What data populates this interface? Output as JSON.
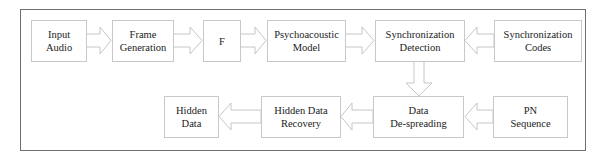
{
  "diagram": {
    "type": "block-flow",
    "nodes": [
      {
        "id": "input_audio",
        "lines": [
          "Input",
          "Audio"
        ]
      },
      {
        "id": "frame_generation",
        "lines": [
          "Frame",
          "Generation"
        ]
      },
      {
        "id": "f",
        "lines": [
          "F"
        ]
      },
      {
        "id": "psychoacoustic_model",
        "lines": [
          "Psychoacoustic",
          "Model"
        ]
      },
      {
        "id": "sync_detection",
        "lines": [
          "Synchronization",
          "Detection"
        ]
      },
      {
        "id": "sync_codes",
        "lines": [
          "Synchronization",
          "Codes"
        ]
      },
      {
        "id": "hidden_data",
        "lines": [
          "Hidden",
          "Data"
        ]
      },
      {
        "id": "hidden_data_recovery",
        "lines": [
          "Hidden Data",
          "Recovery"
        ]
      },
      {
        "id": "data_despreading",
        "lines": [
          "Data",
          "De-spreading"
        ]
      },
      {
        "id": "pn_sequence",
        "lines": [
          "PN",
          "Sequence"
        ]
      }
    ],
    "edges": [
      {
        "from": "input_audio",
        "to": "frame_generation"
      },
      {
        "from": "frame_generation",
        "to": "f"
      },
      {
        "from": "f",
        "to": "psychoacoustic_model"
      },
      {
        "from": "psychoacoustic_model",
        "to": "sync_detection"
      },
      {
        "from": "sync_codes",
        "to": "sync_detection"
      },
      {
        "from": "sync_detection",
        "to": "data_despreading"
      },
      {
        "from": "pn_sequence",
        "to": "data_despreading"
      },
      {
        "from": "data_despreading",
        "to": "hidden_data_recovery"
      },
      {
        "from": "hidden_data_recovery",
        "to": "hidden_data"
      }
    ],
    "colors": {
      "frame_border": "#6e6e6e",
      "box_border": "#c8c8c8",
      "arrow": "#c8c8c8",
      "text": "#222222"
    }
  }
}
